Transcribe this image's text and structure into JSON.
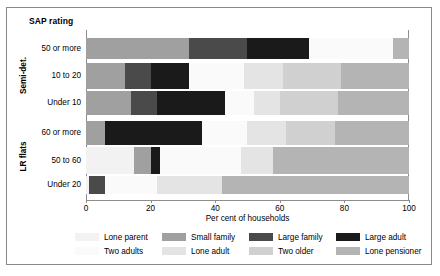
{
  "figure": {
    "title": "SAP rating",
    "xlabel": "Per cent of households"
  },
  "groups": [
    {
      "name": "Semi-det.",
      "label": "Semi-det."
    },
    {
      "name": "LR flats",
      "label": "LR flats"
    }
  ],
  "colors": {
    "lone_parent": "#f2f2f2",
    "small_family": "#a0a0a0",
    "large_family": "#4a4a4a",
    "large_adult": "#1a1a1a",
    "two_adults": "#fafafa",
    "lone_adult": "#e4e4e4",
    "two_older": "#d0d0d0",
    "lone_pensioner": "#b4b4b4",
    "frame": "#8a8a8a",
    "background": "#ffffff"
  },
  "legend": {
    "entries": [
      {
        "label": "Lone parent",
        "key": "lone_parent",
        "color": "#f2f2f2"
      },
      {
        "label": "Two adults",
        "key": "two_adults",
        "color": "#fafafa"
      },
      {
        "label": "Small family",
        "key": "small_family",
        "color": "#a0a0a0"
      },
      {
        "label": "Lone adult",
        "key": "lone_adult",
        "color": "#e4e4e4"
      },
      {
        "label": "Large family",
        "key": "large_family",
        "color": "#4a4a4a"
      },
      {
        "label": "Two older",
        "key": "two_older",
        "color": "#d0d0d0"
      },
      {
        "label": "Large adult",
        "key": "large_adult",
        "color": "#1a1a1a"
      },
      {
        "label": "Lone pensioner",
        "key": "lone_pensioner",
        "color": "#b4b4b4"
      }
    ]
  },
  "chart_data": {
    "type": "bar",
    "orientation": "horizontal",
    "stacked": true,
    "title": "SAP rating",
    "xlabel": "Per cent of households",
    "ylabel": "",
    "xlim": [
      0,
      100
    ],
    "xticks": [
      0,
      20,
      40,
      60,
      80,
      100
    ],
    "xtick_labels": [
      "0",
      "20",
      "40",
      "60",
      "80",
      "100"
    ],
    "grid": false,
    "legend_position": "bottom",
    "group_labels": [
      "Semi-det.",
      "LR flats"
    ],
    "categories": [
      "50 or more",
      "10 to 20",
      "Under 10",
      "60 or more",
      "50 to 60",
      "Under 20"
    ],
    "series": [
      {
        "name": "Lone parent",
        "color": "#f2f2f2",
        "values": [
          0,
          0,
          0,
          0,
          15,
          1
        ]
      },
      {
        "name": "Small family",
        "color": "#a0a0a0",
        "values": [
          32,
          12,
          14,
          6,
          5,
          0
        ]
      },
      {
        "name": "Large family",
        "color": "#4a4a4a",
        "values": [
          18,
          8,
          8,
          0,
          0,
          5
        ]
      },
      {
        "name": "Large adult",
        "color": "#1a1a1a",
        "values": [
          19,
          12,
          21,
          30,
          3,
          0
        ]
      },
      {
        "name": "Two adults",
        "color": "#fafafa",
        "values": [
          26,
          17,
          9,
          14,
          25,
          16
        ]
      },
      {
        "name": "Lone adult",
        "color": "#e4e4e4",
        "values": [
          0,
          12,
          8,
          12,
          10,
          20
        ]
      },
      {
        "name": "Two older",
        "color": "#d0d0d0",
        "values": [
          0,
          18,
          18,
          15,
          0,
          0
        ]
      },
      {
        "name": "Lone pensioner",
        "color": "#b4b4b4",
        "values": [
          5,
          21,
          22,
          23,
          42,
          58
        ]
      }
    ],
    "rows": [
      {
        "category": "50 or more",
        "group": "Semi-det.",
        "segments": [
          {
            "series": "Small family",
            "start": 0,
            "end": 32,
            "value": 32,
            "color": "#a0a0a0"
          },
          {
            "series": "Large family",
            "start": 32,
            "end": 50,
            "value": 18,
            "color": "#4a4a4a"
          },
          {
            "series": "Large adult",
            "start": 50,
            "end": 69,
            "value": 19,
            "color": "#1a1a1a"
          },
          {
            "series": "Two adults",
            "start": 69,
            "end": 95,
            "value": 26,
            "color": "#fafafa"
          },
          {
            "series": "Lone pensioner",
            "start": 95,
            "end": 100,
            "value": 5,
            "color": "#b4b4b4"
          }
        ]
      },
      {
        "category": "10 to 20",
        "group": "Semi-det.",
        "segments": [
          {
            "series": "Small family",
            "start": 0,
            "end": 12,
            "value": 12,
            "color": "#a0a0a0"
          },
          {
            "series": "Large family",
            "start": 12,
            "end": 20,
            "value": 8,
            "color": "#4a4a4a"
          },
          {
            "series": "Large adult",
            "start": 20,
            "end": 32,
            "value": 12,
            "color": "#1a1a1a"
          },
          {
            "series": "Two adults",
            "start": 32,
            "end": 49,
            "value": 17,
            "color": "#fafafa"
          },
          {
            "series": "Lone adult",
            "start": 49,
            "end": 61,
            "value": 12,
            "color": "#e4e4e4"
          },
          {
            "series": "Two older",
            "start": 61,
            "end": 79,
            "value": 18,
            "color": "#d0d0d0"
          },
          {
            "series": "Lone pensioner",
            "start": 79,
            "end": 100,
            "value": 21,
            "color": "#b4b4b4"
          }
        ]
      },
      {
        "category": "Under 10",
        "group": "Semi-det.",
        "segments": [
          {
            "series": "Small family",
            "start": 0,
            "end": 14,
            "value": 14,
            "color": "#a0a0a0"
          },
          {
            "series": "Large family",
            "start": 14,
            "end": 22,
            "value": 8,
            "color": "#4a4a4a"
          },
          {
            "series": "Large adult",
            "start": 22,
            "end": 43,
            "value": 21,
            "color": "#1a1a1a"
          },
          {
            "series": "Two adults",
            "start": 43,
            "end": 52,
            "value": 9,
            "color": "#fafafa"
          },
          {
            "series": "Lone adult",
            "start": 52,
            "end": 60,
            "value": 8,
            "color": "#e4e4e4"
          },
          {
            "series": "Two older",
            "start": 60,
            "end": 78,
            "value": 18,
            "color": "#d0d0d0"
          },
          {
            "series": "Lone pensioner",
            "start": 78,
            "end": 100,
            "value": 22,
            "color": "#b4b4b4"
          }
        ]
      },
      {
        "category": "60 or more",
        "group": "LR flats",
        "segments": [
          {
            "series": "Small family",
            "start": 0,
            "end": 6,
            "value": 6,
            "color": "#a0a0a0"
          },
          {
            "series": "Large adult",
            "start": 6,
            "end": 36,
            "value": 30,
            "color": "#1a1a1a"
          },
          {
            "series": "Two adults",
            "start": 36,
            "end": 50,
            "value": 14,
            "color": "#fafafa"
          },
          {
            "series": "Lone adult",
            "start": 50,
            "end": 62,
            "value": 12,
            "color": "#e4e4e4"
          },
          {
            "series": "Two older",
            "start": 62,
            "end": 77,
            "value": 15,
            "color": "#d0d0d0"
          },
          {
            "series": "Lone pensioner",
            "start": 77,
            "end": 100,
            "value": 23,
            "color": "#b4b4b4"
          }
        ]
      },
      {
        "category": "50 to 60",
        "group": "LR flats",
        "segments": [
          {
            "series": "Lone parent",
            "start": 0,
            "end": 15,
            "value": 15,
            "color": "#f2f2f2"
          },
          {
            "series": "Small family",
            "start": 15,
            "end": 20,
            "value": 5,
            "color": "#a0a0a0"
          },
          {
            "series": "Large adult",
            "start": 20,
            "end": 23,
            "value": 3,
            "color": "#1a1a1a"
          },
          {
            "series": "Two adults",
            "start": 23,
            "end": 48,
            "value": 25,
            "color": "#fafafa"
          },
          {
            "series": "Lone adult",
            "start": 48,
            "end": 58,
            "value": 10,
            "color": "#e4e4e4"
          },
          {
            "series": "Lone pensioner",
            "start": 58,
            "end": 100,
            "value": 42,
            "color": "#b4b4b4"
          }
        ]
      },
      {
        "category": "Under 20",
        "group": "LR flats",
        "segments": [
          {
            "series": "Lone parent",
            "start": 0,
            "end": 1,
            "value": 1,
            "color": "#f2f2f2"
          },
          {
            "series": "Large family",
            "start": 1,
            "end": 6,
            "value": 5,
            "color": "#4a4a4a"
          },
          {
            "series": "Two adults",
            "start": 6,
            "end": 22,
            "value": 16,
            "color": "#fafafa"
          },
          {
            "series": "Lone adult",
            "start": 22,
            "end": 42,
            "value": 20,
            "color": "#e4e4e4"
          },
          {
            "series": "Lone pensioner",
            "start": 42,
            "end": 100,
            "value": 58,
            "color": "#b4b4b4"
          }
        ]
      }
    ]
  }
}
